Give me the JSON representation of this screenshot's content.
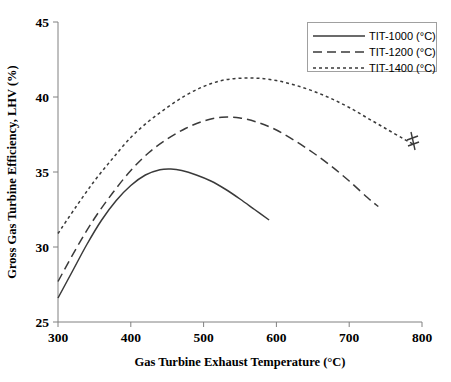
{
  "chart_data": {
    "type": "line",
    "title": "",
    "xlabel": "Gas Turbine Exhaust Temperature (°C)",
    "ylabel": "Gross Gas Turbine Efficiency, LHV (%)",
    "xlim": [
      300,
      800
    ],
    "ylim": [
      25,
      45
    ],
    "xticks": [
      300,
      400,
      500,
      600,
      700,
      800
    ],
    "yticks": [
      25,
      30,
      35,
      40,
      45
    ],
    "xtick_labels": [
      "300",
      "400",
      "500",
      "600",
      "700",
      "800"
    ],
    "ytick_labels": [
      "25",
      "30",
      "35",
      "40",
      "45"
    ],
    "grid": false,
    "legend_position": "top-right",
    "annotations": [
      "axis-break mark at end of TIT-1400 curve near 790 °C"
    ],
    "series": [
      {
        "name": "TIT-1000 (°C)",
        "style": "solid",
        "color": "#3a3a3a",
        "x": [
          300,
          320,
          340,
          360,
          380,
          400,
          420,
          440,
          455,
          470,
          490,
          510,
          530,
          550,
          570,
          590
        ],
        "y": [
          26.6,
          28.4,
          30.2,
          31.8,
          33.1,
          34.1,
          34.8,
          35.15,
          35.2,
          35.1,
          34.8,
          34.4,
          33.85,
          33.2,
          32.5,
          31.8
        ]
      },
      {
        "name": "TIT-1200 (°C)",
        "style": "dashed",
        "color": "#3a3a3a",
        "x": [
          300,
          325,
          350,
          375,
          400,
          425,
          450,
          475,
          500,
          525,
          550,
          575,
          600,
          625,
          650,
          675,
          700,
          725,
          740
        ],
        "y": [
          27.7,
          29.9,
          31.9,
          33.6,
          35.1,
          36.3,
          37.2,
          37.9,
          38.4,
          38.65,
          38.6,
          38.3,
          37.8,
          37.1,
          36.3,
          35.4,
          34.4,
          33.3,
          32.7
        ]
      },
      {
        "name": "TIT-1400 (°C)",
        "style": "dotted",
        "color": "#3a3a3a",
        "x": [
          300,
          325,
          350,
          375,
          400,
          425,
          450,
          475,
          500,
          525,
          550,
          575,
          600,
          625,
          650,
          675,
          700,
          725,
          750,
          775,
          790
        ],
        "y": [
          30.9,
          32.7,
          34.4,
          35.9,
          37.3,
          38.4,
          39.3,
          40.1,
          40.7,
          41.1,
          41.25,
          41.25,
          41.1,
          40.8,
          40.4,
          39.9,
          39.3,
          38.6,
          37.9,
          37.2,
          36.8
        ]
      }
    ]
  },
  "legend": {
    "entries": [
      {
        "label": "TIT-1000 (°C)",
        "style": "solid"
      },
      {
        "label": "TIT-1200 (°C)",
        "style": "dashed"
      },
      {
        "label": "TIT-1400 (°C)",
        "style": "dotted"
      }
    ]
  }
}
